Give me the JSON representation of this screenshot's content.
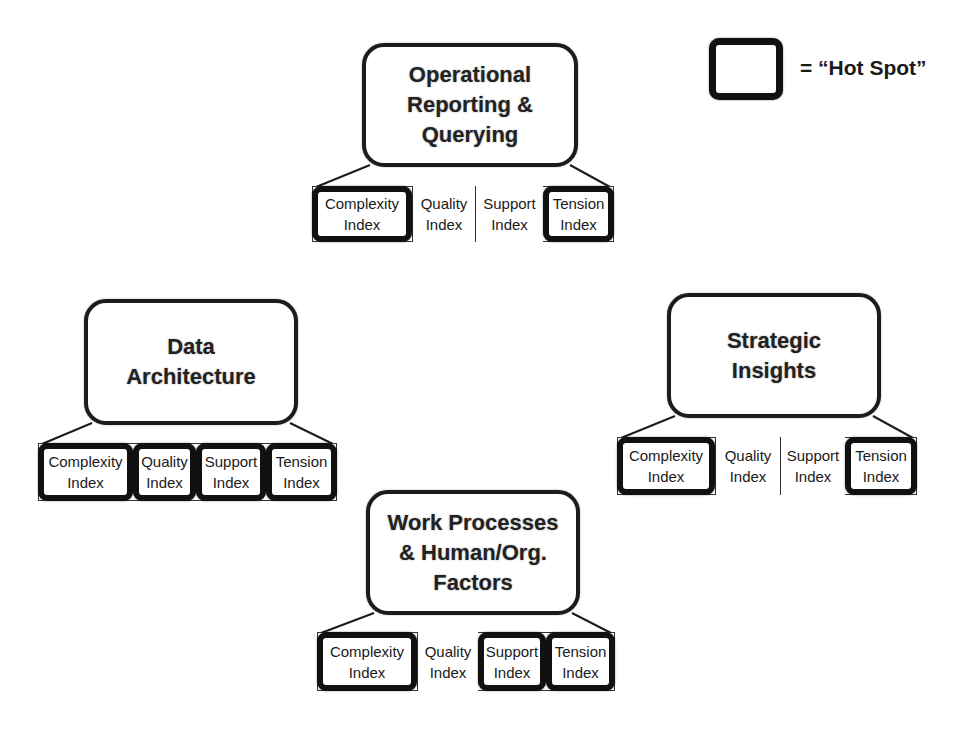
{
  "legend": {
    "label": "= “Hot Spot”",
    "meaning": "thick-bordered box"
  },
  "colors": {
    "stroke": "#1c1c1c",
    "hot_spot_border": "#111111",
    "background": "#ffffff",
    "text": "#1a1a1a"
  },
  "blocks": [
    {
      "id": "operational-reporting",
      "title": "Operational\nReporting &\nQuerying",
      "box": {
        "x": 362,
        "y": 43,
        "w": 216,
        "h": 124
      },
      "row": {
        "x": 312,
        "y": 186,
        "w": 302,
        "h": 56
      },
      "cells": [
        {
          "line1": "Complexity",
          "line2": "Index",
          "hot": true,
          "x": 312,
          "w": 100
        },
        {
          "line1": "Quality",
          "line2": "Index",
          "hot": false,
          "x": 412,
          "w": 63
        },
        {
          "line1": "Support",
          "line2": "Index",
          "hot": false,
          "x": 475,
          "w": 68
        },
        {
          "line1": "Tension",
          "line2": "Index",
          "hot": true,
          "x": 543,
          "w": 71
        }
      ]
    },
    {
      "id": "data-architecture",
      "title": "Data\nArchitecture",
      "box": {
        "x": 84,
        "y": 299,
        "w": 214,
        "h": 126
      },
      "row": {
        "x": 38,
        "y": 443,
        "w": 299,
        "h": 58
      },
      "cells": [
        {
          "line1": "Complexity",
          "line2": "Index",
          "hot": true,
          "x": 38,
          "w": 95
        },
        {
          "line1": "Quality",
          "line2": "Index",
          "hot": true,
          "x": 133,
          "w": 63
        },
        {
          "line1": "Support",
          "line2": "Index",
          "hot": true,
          "x": 196,
          "w": 70
        },
        {
          "line1": "Tension",
          "line2": "Index",
          "hot": true,
          "x": 266,
          "w": 71
        }
      ]
    },
    {
      "id": "strategic-insights",
      "title": "Strategic\nInsights",
      "box": {
        "x": 667,
        "y": 293,
        "w": 214,
        "h": 125
      },
      "row": {
        "x": 617,
        "y": 437,
        "w": 300,
        "h": 58
      },
      "cells": [
        {
          "line1": "Complexity",
          "line2": "Index",
          "hot": true,
          "x": 617,
          "w": 98
        },
        {
          "line1": "Quality",
          "line2": "Index",
          "hot": false,
          "x": 715,
          "w": 65
        },
        {
          "line1": "Support",
          "line2": "Index",
          "hot": false,
          "x": 780,
          "w": 65
        },
        {
          "line1": "Tension",
          "line2": "Index",
          "hot": true,
          "x": 845,
          "w": 72
        }
      ]
    },
    {
      "id": "work-processes",
      "title": "Work Processes\n& Human/Org.\nFactors",
      "box": {
        "x": 366,
        "y": 490,
        "w": 214,
        "h": 125
      },
      "row": {
        "x": 317,
        "y": 632,
        "w": 298,
        "h": 59
      },
      "cells": [
        {
          "line1": "Complexity",
          "line2": "Index",
          "hot": true,
          "x": 317,
          "w": 100
        },
        {
          "line1": "Quality",
          "line2": "Index",
          "hot": false,
          "x": 417,
          "w": 61
        },
        {
          "line1": "Support",
          "line2": "Index",
          "hot": true,
          "x": 478,
          "w": 68
        },
        {
          "line1": "Tension",
          "line2": "Index",
          "hot": true,
          "x": 546,
          "w": 69
        }
      ]
    }
  ]
}
